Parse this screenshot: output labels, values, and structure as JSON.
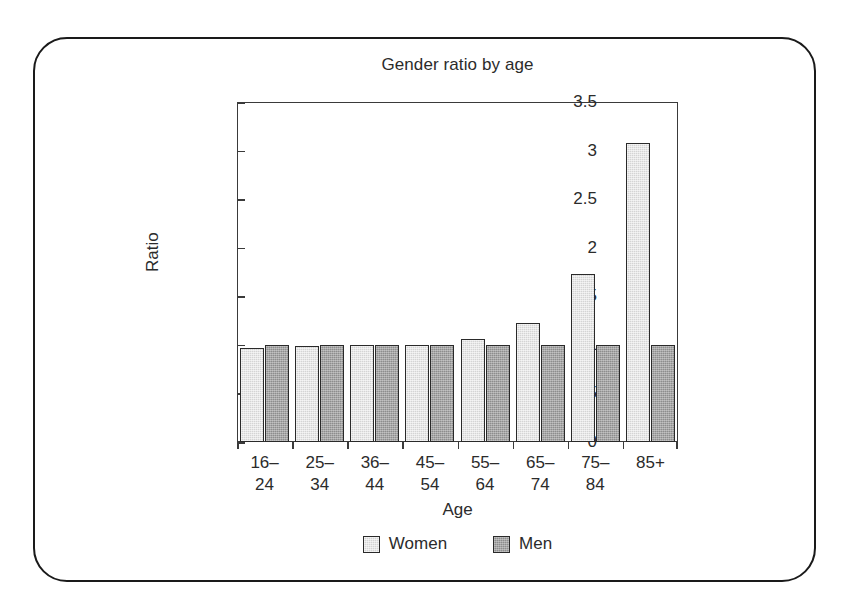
{
  "chart_data": {
    "type": "bar",
    "title": "Gender ratio by age",
    "xlabel": "Age",
    "ylabel": "Ratio",
    "categories": [
      "16–\n24",
      "25–\n34",
      "36–\n44",
      "45–\n54",
      "55–\n64",
      "65–\n74",
      "75–\n84",
      "85+"
    ],
    "series": [
      {
        "name": "Women",
        "color": "#d4d4d4",
        "values": [
          0.97,
          0.99,
          1.0,
          1.0,
          1.06,
          1.22,
          1.73,
          3.08
        ]
      },
      {
        "name": "Men",
        "color": "#8d8d8d",
        "values": [
          1.0,
          1.0,
          1.0,
          1.0,
          1.0,
          1.0,
          1.0,
          1.0
        ]
      }
    ],
    "ylim": [
      0,
      3.5
    ],
    "yticks": [
      0,
      0.5,
      1,
      1.5,
      2,
      2.5,
      3,
      3.5
    ],
    "ytick_labels": [
      "0",
      "0.5",
      "1",
      "1.5",
      "2",
      "2.5",
      "3",
      "3.5"
    ],
    "grid": false,
    "legend_position": "bottom-center"
  }
}
